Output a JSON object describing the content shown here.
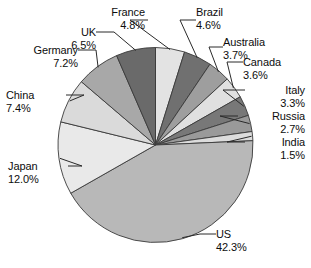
{
  "chart_data": {
    "type": "pie",
    "title": "",
    "subtitle": "",
    "xlabel": "",
    "ylabel": "",
    "legend": "none",
    "grid": false,
    "value_unit": "%",
    "start_angle_deg": 0,
    "direction": "clockwise",
    "categories": [
      "France",
      "Brazil",
      "Australia",
      "Canada",
      "Italy",
      "Russia",
      "India",
      "US",
      "Japan",
      "China",
      "Germany",
      "UK"
    ],
    "values": [
      4.8,
      4.6,
      3.7,
      3.6,
      3.3,
      2.7,
      1.5,
      42.3,
      12.0,
      7.4,
      7.2,
      6.5
    ],
    "slices": [
      {
        "label": "France",
        "value": 4.8,
        "value_text": "4.8%",
        "color": "#e3e3e3"
      },
      {
        "label": "Brazil",
        "value": 4.6,
        "value_text": "4.6%",
        "color": "#707070"
      },
      {
        "label": "Australia",
        "value": 3.7,
        "value_text": "3.7%",
        "color": "#9e9e9e"
      },
      {
        "label": "Canada",
        "value": 3.6,
        "value_text": "3.6%",
        "color": "#e0e0e0"
      },
      {
        "label": "Italy",
        "value": 3.3,
        "value_text": "3.3%",
        "color": "#787878"
      },
      {
        "label": "Russia",
        "value": 2.7,
        "value_text": "2.7%",
        "color": "#9a9a9a"
      },
      {
        "label": "India",
        "value": 1.5,
        "value_text": "1.5%",
        "color": "#dcdcdc"
      },
      {
        "label": "US",
        "value": 42.3,
        "value_text": "42.3%",
        "color": "#b8b8b8"
      },
      {
        "label": "Japan",
        "value": 12.0,
        "value_text": "12.0%",
        "color": "#e9e9e9"
      },
      {
        "label": "China",
        "value": 7.4,
        "value_text": "7.4%",
        "color": "#dadada"
      },
      {
        "label": "Germany",
        "value": 7.2,
        "value_text": "7.2%",
        "color": "#a8a8a8"
      },
      {
        "label": "UK",
        "value": 6.5,
        "value_text": "6.5%",
        "color": "#6a6a6a"
      }
    ]
  },
  "labels": {
    "france": {
      "name": "France",
      "value": "4.8%"
    },
    "brazil": {
      "name": "Brazil",
      "value": "4.6%"
    },
    "australia": {
      "name": "Australia",
      "value": "3.7%"
    },
    "canada": {
      "name": "Canada",
      "value": "3.6%"
    },
    "italy": {
      "name": "Italy",
      "value": "3.3%"
    },
    "russia": {
      "name": "Russia",
      "value": "2.7%"
    },
    "india": {
      "name": "India",
      "value": "1.5%"
    },
    "us": {
      "name": "US",
      "value": "42.3%"
    },
    "japan": {
      "name": "Japan",
      "value": "12.0%"
    },
    "china": {
      "name": "China",
      "value": "7.4%"
    },
    "germany": {
      "name": "Germany",
      "value": "7.2%"
    },
    "uk": {
      "name": "UK",
      "value": "6.5%"
    }
  },
  "style": {
    "background": "#ffffff",
    "slice_outline": "#3a3a3a",
    "leader_line": "#2a2a2a",
    "text_color": "#0d0d0d"
  }
}
